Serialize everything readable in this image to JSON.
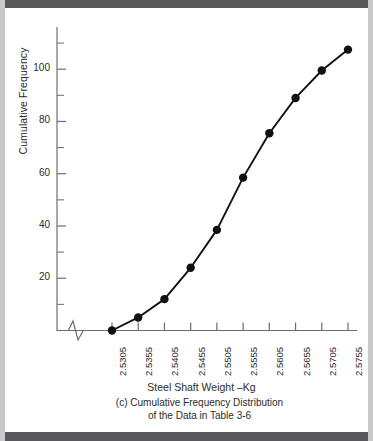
{
  "figure": {
    "axis_color": "#6d6d6d",
    "series_color": "#111111",
    "rule_color": "#58585a",
    "xlabel": "Steel Shaft Weight –Kg",
    "ylabel": "Cumulative Frequency",
    "caption_line1": "(c) Cumulative Frequency Distribution",
    "caption_line2": "of the Data in Table 3-6",
    "axis_break": "zigzag-break"
  },
  "chart_data": {
    "type": "line",
    "title": "(c) Cumulative Frequency Distribution of the Data in Table 3-6",
    "xlabel": "Steel Shaft Weight –Kg",
    "ylabel": "Cumulative Frequency",
    "categories": [
      "2.5305",
      "2.5355",
      "2.5405",
      "2.5455",
      "2.5505",
      "2.5555",
      "2.5605",
      "2.5655",
      "2.5705",
      "2.5755"
    ],
    "x": [
      2.5305,
      2.5355,
      2.5405,
      2.5455,
      2.5505,
      2.5555,
      2.5605,
      2.5655,
      2.5705,
      2.5755
    ],
    "values": [
      0,
      5,
      12,
      24,
      38.5,
      58.5,
      75.5,
      89,
      99.5,
      107.5
    ],
    "ylim": [
      0,
      115
    ],
    "y_major_ticks": [
      20,
      40,
      60,
      80,
      100
    ],
    "y_minor_ticks": [
      10,
      30,
      50,
      70,
      90,
      110
    ],
    "y_tick_labels": [
      "20",
      "40",
      "60",
      "80",
      "100"
    ],
    "grid": false,
    "legend": "none",
    "markers": "filled-circle",
    "axis_break_on_x": true
  }
}
